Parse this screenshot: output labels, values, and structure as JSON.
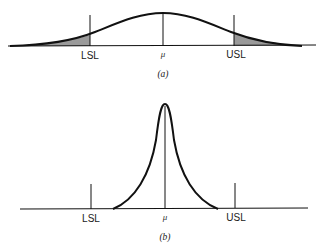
{
  "panels": [
    {
      "id": "a",
      "caption": "(a)",
      "labels": {
        "lsl": "LSL",
        "mean": "μ",
        "usl": "USL"
      },
      "description": "Wide normal distribution with tails beyond LSL and USL shaded"
    },
    {
      "id": "b",
      "caption": "(b)",
      "labels": {
        "lsl": "LSL",
        "mean": "μ",
        "usl": "USL"
      },
      "description": "Narrow distribution entirely within LSL and USL"
    }
  ],
  "colors": {
    "line": "#111111",
    "shade": "#9a9a9a",
    "background": "#ffffff"
  },
  "footer_text": ""
}
